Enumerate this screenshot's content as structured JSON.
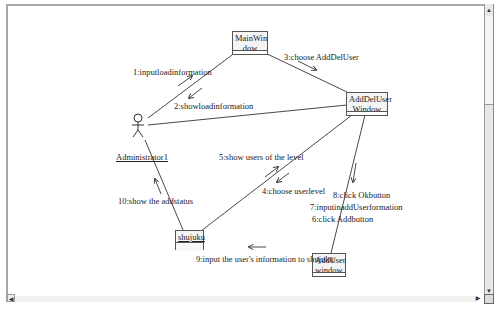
{
  "diagram": {
    "type": "UML collaboration diagram",
    "actor": {
      "name": "Administrator1"
    },
    "objects": [
      {
        "id": "mainwindow",
        "line1": "MainWin",
        "line2": "dow"
      },
      {
        "id": "adddeluser",
        "line1": "AddDelUser",
        "line2": "Window"
      },
      {
        "id": "shujuku",
        "line1": "shujuku",
        "line2": ""
      },
      {
        "id": "adduser",
        "line1": "AddUser",
        "line2": "window"
      }
    ],
    "messages": [
      {
        "num": 1,
        "text": "1:inputloadinformation",
        "from": "Administrator1",
        "to": "MainWindow"
      },
      {
        "num": 2,
        "text": "2:showloadinformation",
        "from": "MainWindow",
        "to": "Administrator1"
      },
      {
        "num": 3,
        "text": "3:choose AddDelUser",
        "from": "MainWindow",
        "to": "AddDelUser Window"
      },
      {
        "num": 4,
        "text": "4:choose userlevel",
        "from": "AddDelUser Window",
        "to": "shujuku"
      },
      {
        "num": 5,
        "text": "5:show users of the level",
        "from": "shujuku",
        "to": "AddDelUser Window"
      },
      {
        "num": 6,
        "text": "6:click Addbutton",
        "from": "AddDelUser Window",
        "to": "AddUser window"
      },
      {
        "num": 7,
        "text": "7:inputinaddUserformation",
        "from": "AddDelUser Window",
        "to": "AddUser window"
      },
      {
        "num": 8,
        "text": "8:click Okbutton",
        "from": "AddDelUser Window",
        "to": "AddUser window"
      },
      {
        "num": 9,
        "text": "9:input the user's information to shujuku",
        "from": "AddUser window",
        "to": "shujuku"
      },
      {
        "num": 10,
        "text": "10:show the addstatus",
        "from": "shujuku",
        "to": "Administrator1"
      }
    ]
  },
  "scrollbars": {
    "up_arrow": "▲",
    "down_arrow": "▼",
    "left_arrow": "◀",
    "right_arrow": "▶"
  },
  "colors": {
    "line": "#333333",
    "object_fill": "#f4f4f4",
    "frame": "#a8a8a8"
  }
}
